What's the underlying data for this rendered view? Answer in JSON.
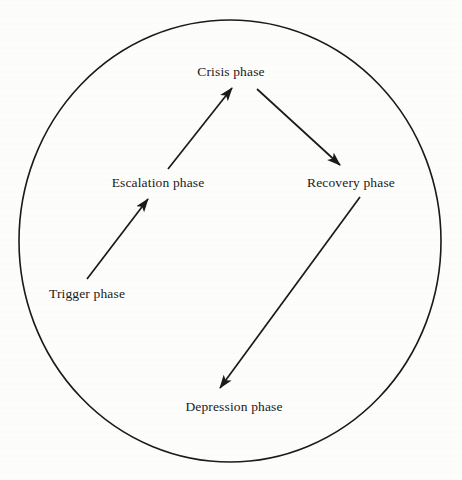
{
  "diagram": {
    "background_color": "#fdfdfc",
    "stroke_color": "#1a1a1a",
    "boundary": {
      "shape": "ellipse",
      "cx": 230,
      "cy": 241,
      "rx": 211,
      "ry": 221,
      "stroke_width": 1.6
    },
    "nodes": [
      {
        "id": "crisis",
        "label": "Crisis phase",
        "x": 231,
        "y": 72
      },
      {
        "id": "escalation",
        "label": "Escalation phase",
        "x": 158,
        "y": 183
      },
      {
        "id": "recovery",
        "label": "Recovery phase",
        "x": 351,
        "y": 183
      },
      {
        "id": "trigger",
        "label": "Trigger phase",
        "x": 87,
        "y": 294
      },
      {
        "id": "depression",
        "label": "Depression phase",
        "x": 234,
        "y": 407
      }
    ],
    "edges": [
      {
        "id": "trigger-to-escalation",
        "from": "trigger",
        "to": "escalation",
        "x1": 87,
        "y1": 279,
        "x2": 148,
        "y2": 199
      },
      {
        "id": "escalation-to-crisis",
        "from": "escalation",
        "to": "crisis",
        "x1": 168,
        "y1": 169,
        "x2": 232,
        "y2": 88
      },
      {
        "id": "crisis-to-recovery",
        "from": "crisis",
        "to": "recovery",
        "x1": 257,
        "y1": 89,
        "x2": 340,
        "y2": 165
      },
      {
        "id": "recovery-to-depression",
        "from": "recovery",
        "to": "depression",
        "x1": 360,
        "y1": 197,
        "x2": 220,
        "y2": 388
      }
    ]
  }
}
